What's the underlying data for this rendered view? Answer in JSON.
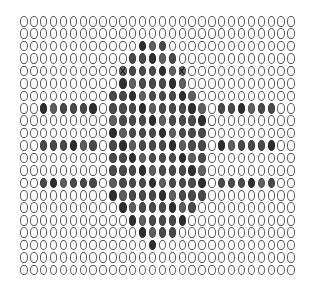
{
  "grid": {
    "cols": 28,
    "rows": 21,
    "legend": {
      "O": "empty-oval",
      "F": "filled-oval",
      "X": "crossed-oval"
    },
    "row_patterns": [
      "OOOOOOOOOOOOOOOOOOOOOOOOOOOO",
      "OOOOOOOOOOOOOOOOOOOOOOOOOOOO",
      "OOOOOOOOOOOOFFFOOOOOOOOOOOOO",
      "OOOOOOOOOOOFFFFFOOOOOOOOOOOO",
      "OOOOOOOOOOXFFFFFXOOOOOOOOOOO",
      "OOOOOOOOOOFFFFFFFOOOOOOOOOOO",
      "OOOOOOOOOFFFFFFFFFOOOOOOOOOO",
      "OOFFFFFFOFFFFFFFFFFOFFFFFFOO",
      "OOOOOOOOOFFFFFFFFFFOOOOOOOOO",
      "OOOOOOOOOFFFFFFFFFFOOOOOOOOO",
      "OOFFFFFFOFFFFFFFFFFOFFFFFFOO",
      "OOOOOOOOOFFFFFFFFFFOOOOOOOOO",
      "OOOOOOOOOFFFFFFFFFFOOOOOOOOO",
      "OOFFFFFFOFFFFFFFFFFOFFFFFFOO",
      "OOOOOOOOOFFFFFFFFFFOOOOOOOOO",
      "OOOOOOOOOOFFFFFFFFOOOOOOOOOO",
      "OOOOOOOOOOOFFFFFFOOOOOOOOOOO",
      "OOOOOOOOOOOOFFFFOOOOOOOOOOOO",
      "OOOOOOOOOOOOOFOOOOOOOOOOOOOO",
      "OOOOOOOOOOOOOOOOOOOOOOOOOOOO",
      "OOOOOOOOOOOOOOOOOOOOOOOOOOOO"
    ],
    "colors": {
      "background": "#ffffff",
      "oval_outline": "#555555",
      "filled": "#4a4a4a"
    }
  }
}
